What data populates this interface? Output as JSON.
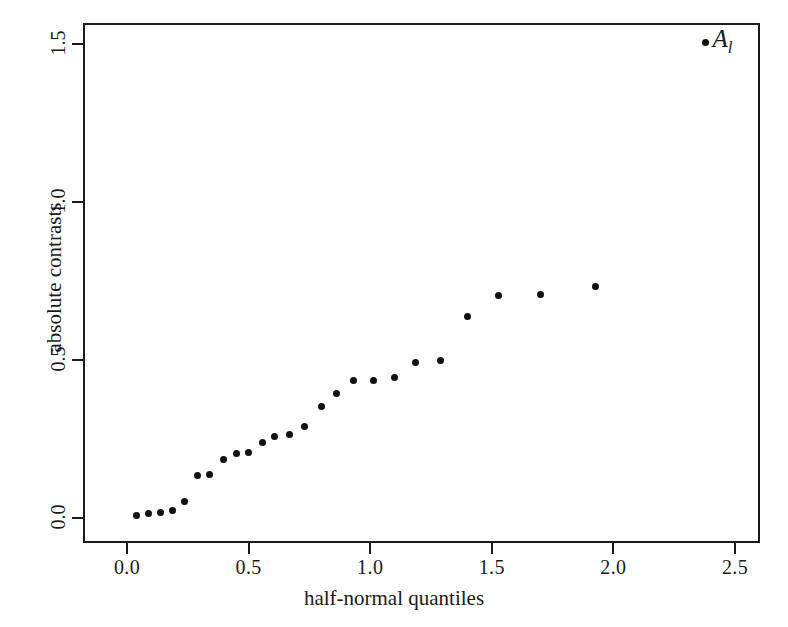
{
  "chart_data": {
    "type": "scatter",
    "title": "",
    "xlabel": "half-normal quantiles",
    "ylabel": "absolute contrasts",
    "xlim": [
      -0.09,
      2.73
    ],
    "ylim": [
      -0.035,
      1.565
    ],
    "xticks": [
      0.0,
      0.5,
      1.0,
      1.5,
      2.0,
      2.5
    ],
    "xticklabels": [
      "0.0",
      "0.5",
      "1.0",
      "1.5",
      "2.0",
      "2.5"
    ],
    "yticks": [
      0.0,
      0.5,
      1.0,
      1.5
    ],
    "yticklabels": [
      "0.0",
      "0.5",
      "1.0",
      "1.5"
    ],
    "grid": false,
    "legend": null,
    "marker": "filled-circle",
    "marker_color": "#111111",
    "x": [
      0.03,
      0.08,
      0.13,
      0.18,
      0.23,
      0.28,
      0.33,
      0.39,
      0.44,
      0.49,
      0.55,
      0.6,
      0.66,
      0.72,
      0.79,
      0.855,
      0.925,
      1.005,
      1.09,
      1.18,
      1.28,
      1.39,
      1.52,
      1.69,
      1.92,
      2.37
    ],
    "y": [
      0.015,
      0.02,
      0.025,
      0.03,
      0.06,
      0.14,
      0.145,
      0.19,
      0.21,
      0.215,
      0.245,
      0.265,
      0.27,
      0.295,
      0.36,
      0.4,
      0.44,
      0.44,
      0.45,
      0.5,
      0.505,
      0.645,
      0.71,
      0.715,
      0.74,
      1.51
    ],
    "annotations": [
      {
        "label_main": "A",
        "label_sub": "l",
        "x": 2.37,
        "y": 1.51,
        "point_index": 25
      }
    ]
  },
  "figure": {
    "background": "#ffffff",
    "frame_color": "#1a1a1a"
  }
}
